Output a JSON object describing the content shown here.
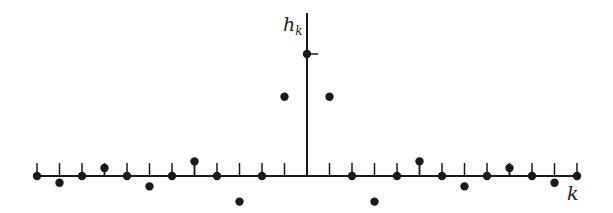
{
  "chart_data": {
    "type": "scatter",
    "subtype": "stem",
    "title": "",
    "xlabel": "k",
    "ylabel": "h_k",
    "ylabel_main": "h",
    "ylabel_sub": "k",
    "x": [
      -12,
      -11,
      -10,
      -9,
      -8,
      -7,
      -6,
      -5,
      -4,
      -3,
      -2,
      -1,
      0,
      1,
      2,
      3,
      4,
      5,
      6,
      7,
      8,
      9,
      10,
      11,
      12
    ],
    "values": [
      0,
      -0.055,
      0,
      0.065,
      0,
      -0.085,
      0,
      0.12,
      0,
      -0.21,
      0,
      0.65,
      1.0,
      0.65,
      0,
      -0.21,
      0,
      0.12,
      0,
      -0.085,
      0,
      0.065,
      0,
      -0.055,
      0
    ],
    "xlim": [
      -12,
      12
    ],
    "ylim": [
      -0.25,
      1.35
    ],
    "grid": false,
    "legend": null,
    "annotations": [
      "tick mark on vertical axis at h_0 level"
    ],
    "colors": {
      "ink": "#1a1a1a",
      "background": "#ffffff"
    }
  }
}
